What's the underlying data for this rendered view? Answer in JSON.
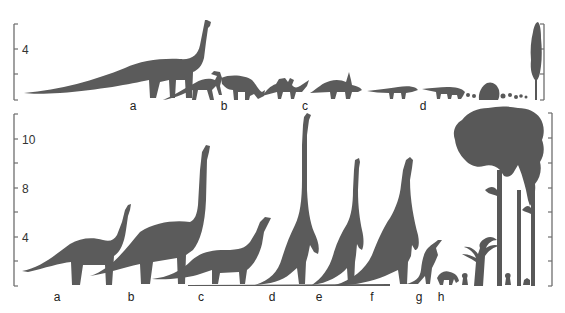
{
  "figure": {
    "top_panel": {
      "axis": {
        "tick_labels": [
          "4"
        ],
        "tick_count": 4
      },
      "labels": [
        "a",
        "b",
        "c",
        "d"
      ],
      "silhouettes": [
        {
          "label": "a",
          "description": "long-necked sauropod with very long tail"
        },
        {
          "label": "b",
          "description": "two crested hadrosaurs"
        },
        {
          "label": "c",
          "description": "two horned ceratopsians"
        },
        {
          "label": "d",
          "description": "two low armored ankylosaurs"
        },
        {
          "label": "",
          "description": "low shrubs and a tall narrow conifer"
        }
      ]
    },
    "bottom_panel": {
      "axis": {
        "tick_labels": [
          "10",
          "8",
          "4"
        ],
        "tick_count": 8
      },
      "labels": [
        "a",
        "b",
        "c",
        "d",
        "e",
        "f",
        "g",
        "h"
      ],
      "silhouettes": [
        {
          "label": "a",
          "description": "small sauropod, neck raised"
        },
        {
          "label": "b",
          "description": "large sauropod, very tall neck"
        },
        {
          "label": "c",
          "description": "medium sauropod"
        },
        {
          "label": "d",
          "description": "rearing sauropod, tallest neck"
        },
        {
          "label": "e",
          "description": "rearing sauropod"
        },
        {
          "label": "f",
          "description": "rearing sauropod"
        },
        {
          "label": "g",
          "description": "small rearing dinosaur"
        },
        {
          "label": "h",
          "description": "small quadruped"
        },
        {
          "label": "",
          "description": "cycad/palm, tall conifer trees with small figures"
        }
      ]
    },
    "colors": {
      "silhouette": "#5b5b5b",
      "axis": "#6e6e6e",
      "background": "#ffffff"
    }
  }
}
